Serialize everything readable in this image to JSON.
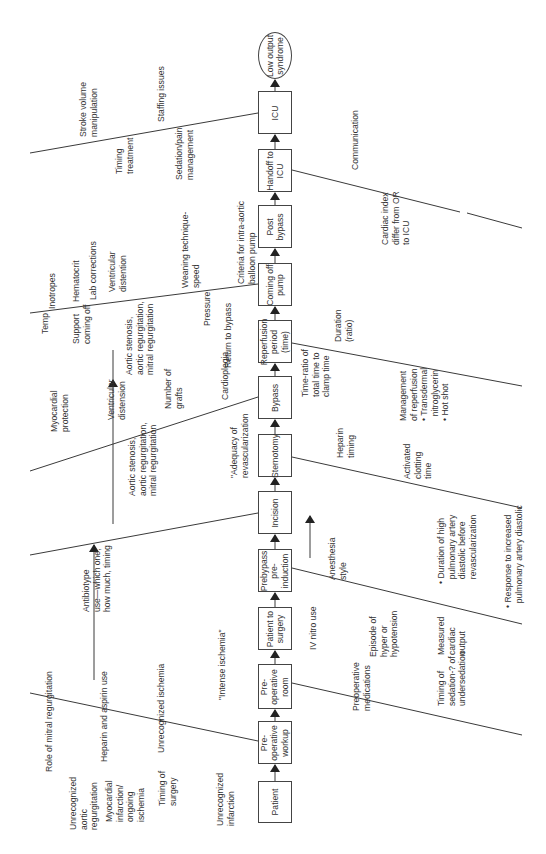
{
  "colors": {
    "line": "#3a3a3a",
    "text": "#333333",
    "background": "#ffffff"
  },
  "process_steps": [
    {
      "id": "patient",
      "label": "Patient",
      "x": 258,
      "y": 781,
      "w": 34,
      "h": 42,
      "shape": "rect"
    },
    {
      "id": "preop-workup",
      "label": "Pre-\noperative\nworkup",
      "x": 258,
      "y": 721,
      "w": 34,
      "h": 43,
      "shape": "rect"
    },
    {
      "id": "preop-room",
      "label": "Pre-\noperative\nroom",
      "x": 258,
      "y": 664,
      "w": 34,
      "h": 45,
      "shape": "rect"
    },
    {
      "id": "patient-to-surgery",
      "label": "Patient to\nsurgery",
      "x": 258,
      "y": 607,
      "w": 34,
      "h": 43,
      "shape": "rect"
    },
    {
      "id": "prebypass",
      "label": "Prebypass\npre-\ninduction",
      "x": 258,
      "y": 549,
      "w": 34,
      "h": 43,
      "shape": "rect"
    },
    {
      "id": "incision",
      "label": "Incision",
      "x": 258,
      "y": 491,
      "w": 34,
      "h": 43,
      "shape": "rect"
    },
    {
      "id": "sternotomy",
      "label": "Sternotomy",
      "x": 258,
      "y": 434,
      "w": 34,
      "h": 43,
      "shape": "rect"
    },
    {
      "id": "bypass",
      "label": "Bypass",
      "x": 258,
      "y": 376,
      "w": 34,
      "h": 43,
      "shape": "rect"
    },
    {
      "id": "reperfusion",
      "label": "Reperfusion\nperiod\n(time)",
      "x": 258,
      "y": 320,
      "w": 34,
      "h": 43,
      "shape": "rect"
    },
    {
      "id": "coming-off-pump",
      "label": "Coming off\npump",
      "x": 258,
      "y": 263,
      "w": 34,
      "h": 43,
      "shape": "rect"
    },
    {
      "id": "post-bypass",
      "label": "Post\nbypass",
      "x": 258,
      "y": 205,
      "w": 34,
      "h": 43,
      "shape": "rect"
    },
    {
      "id": "handoff-icu",
      "label": "Handoff to\nICU",
      "x": 258,
      "y": 149,
      "w": 34,
      "h": 43,
      "shape": "rect"
    },
    {
      "id": "icu",
      "label": "ICU",
      "x": 258,
      "y": 91,
      "w": 34,
      "h": 43,
      "shape": "rect"
    },
    {
      "id": "low-output",
      "label": "Low output\nsyndrome",
      "x": 258,
      "y": 32,
      "w": 34,
      "h": 47,
      "shape": "oval"
    }
  ],
  "bones": [
    {
      "x1": 30,
      "y1": 153,
      "x2": 258,
      "y2": 113
    },
    {
      "x1": 30,
      "y1": 313,
      "x2": 258,
      "y2": 284
    },
    {
      "x1": 30,
      "y1": 471,
      "x2": 258,
      "y2": 397
    },
    {
      "x1": 30,
      "y1": 555,
      "x2": 258,
      "y2": 513
    },
    {
      "x1": 30,
      "y1": 693,
      "x2": 258,
      "y2": 741
    },
    {
      "x1": 292,
      "y1": 170,
      "x2": 460,
      "y2": 212
    },
    {
      "x1": 292,
      "y1": 343,
      "x2": 522,
      "y2": 386
    },
    {
      "x1": 292,
      "y1": 457,
      "x2": 522,
      "y2": 508
    },
    {
      "x1": 292,
      "y1": 568,
      "x2": 522,
      "y2": 624
    },
    {
      "x1": 292,
      "y1": 683,
      "x2": 522,
      "y2": 735
    }
  ],
  "bone_gap_segment": {
    "x1": 467,
    "y1": 213,
    "x2": 522,
    "y2": 228
  },
  "influence_arrows": [
    {
      "x1": 94,
      "y1": 680,
      "x2": 94,
      "y2": 545
    },
    {
      "x1": 113,
      "y1": 524,
      "x2": 113,
      "y2": 380
    },
    {
      "x1": 310,
      "y1": 558,
      "x2": 310,
      "y2": 516
    }
  ],
  "arrow_tail_lines": [
    {
      "x1": 113,
      "y1": 380,
      "x2": 113,
      "y2": 350
    }
  ],
  "causes": [
    {
      "text": "Unrecognized\naortic\nregurgitation",
      "x": 68,
      "y": 830
    },
    {
      "text": "Myocardial\ninfarction/\nongoing\nischemia",
      "x": 104,
      "y": 822
    },
    {
      "text": "Timing of\nsurgery",
      "x": 157,
      "y": 806
    },
    {
      "text": "Unrecognized\ninfarction",
      "x": 215,
      "y": 826
    },
    {
      "text": "Role of mitral regurgitation",
      "x": 44,
      "y": 772
    },
    {
      "text": "Heparin and aspirin use",
      "x": 99,
      "y": 762
    },
    {
      "text": "Unrecognized ischemia",
      "x": 156,
      "y": 753
    },
    {
      "text": "\"Intense ischemia\"",
      "x": 217,
      "y": 700
    },
    {
      "text": "Antibiotype\nuse—which one,\nhow much, timing",
      "x": 81,
      "y": 612
    },
    {
      "text": "Aortic stenosis,\naortic regurgitation,\nmitral regurgitation",
      "x": 127,
      "y": 496
    },
    {
      "text": "\"Adequacy of\nrevascularization",
      "x": 229,
      "y": 478
    },
    {
      "text": "Myocardial\nprotection",
      "x": 49,
      "y": 432
    },
    {
      "text": "Ventricular\ndistension",
      "x": 106,
      "y": 420
    },
    {
      "text": "Number of\ngrafts",
      "x": 163,
      "y": 409
    },
    {
      "text": "Cardioplegia",
      "x": 220,
      "y": 400
    },
    {
      "text": "Temp",
      "x": 40,
      "y": 334
    },
    {
      "text": "Support\ncoming off",
      "x": 71,
      "y": 344
    },
    {
      "text": "Aortic stenosis,\naortic regurgitation,\nmitral regurgitation",
      "x": 124,
      "y": 375
    },
    {
      "text": "Pressure",
      "x": 202,
      "y": 326
    },
    {
      "text": "Return to bypass",
      "x": 223,
      "y": 368
    },
    {
      "text": "Inotropes",
      "x": 47,
      "y": 309
    },
    {
      "text": "Hematocrit",
      "x": 71,
      "y": 302
    },
    {
      "text": "Lab corrections",
      "x": 88,
      "y": 300
    },
    {
      "text": "Ventricular\ndistention",
      "x": 107,
      "y": 292
    },
    {
      "text": "Weaning technique-\nspeed",
      "x": 180,
      "y": 288
    },
    {
      "text": "Criteria for intra-aortic\nballoon pump",
      "x": 236,
      "y": 284
    },
    {
      "text": "Stroke volume\nmanipulation",
      "x": 78,
      "y": 137
    },
    {
      "text": "Timing\ntreatment",
      "x": 114,
      "y": 174
    },
    {
      "text": "Staffing issues",
      "x": 156,
      "y": 122
    },
    {
      "text": "Sedation/pain\nmanagement",
      "x": 174,
      "y": 180
    },
    {
      "text": "Communication",
      "x": 350,
      "y": 170
    },
    {
      "text": "Cardiac index\ndiffer from OR\nto ICU",
      "x": 380,
      "y": 245
    },
    {
      "text": "Duration\n(ratio)",
      "x": 333,
      "y": 342
    },
    {
      "text": "Time-ratio of\ntotal time to\nclamp time",
      "x": 300,
      "y": 397
    },
    {
      "text": "Management\nof reperfusion\n• Transdermal\n  nitroglycerin\n• Hot shot",
      "x": 398,
      "y": 421
    },
    {
      "text": "Heparin\ntiming",
      "x": 335,
      "y": 458
    },
    {
      "text": "Activated\nclotting\ntime",
      "x": 402,
      "y": 479
    },
    {
      "text": "IV nitro use",
      "x": 308,
      "y": 650
    },
    {
      "text": "Anesthesia\nstyle",
      "x": 327,
      "y": 580
    },
    {
      "text": "Episode of\nhyper or\nhypotension",
      "x": 368,
      "y": 657
    },
    {
      "text": "Measured\ncardiac\noutput",
      "x": 436,
      "y": 655
    },
    {
      "text": "• Duration of high\n  pulmonary artery\n  diastolic before\n  revascularization",
      "x": 436,
      "y": 584
    },
    {
      "text": "• Response to increased\n  pulmonary artery diastolic",
      "x": 503,
      "y": 608
    },
    {
      "text": "Timing of\nsedation-? of\nundersedation",
      "x": 436,
      "y": 706
    },
    {
      "text": "Preoperative\nmedications",
      "x": 351,
      "y": 711
    }
  ]
}
